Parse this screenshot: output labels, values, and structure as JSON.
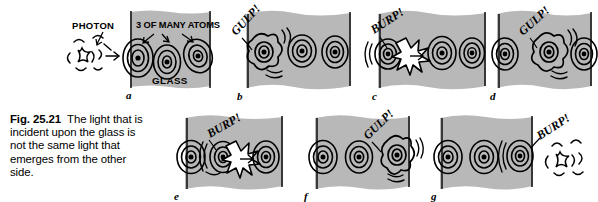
{
  "figure": {
    "number": "Fig. 25.21",
    "caption_text": "The light that is incident upon the glass is not the same light that emerges from the other side.",
    "glass_color": "#b8b8b8",
    "ink_color": "#000000",
    "background_color": "#ffffff"
  },
  "annotations": {
    "photon_label": "PHOTON",
    "atoms_label": "3 OF MANY ATOMS",
    "glass_label": "GLASS"
  },
  "panels": [
    {
      "letter": "a",
      "sound": "",
      "caption_labels": [
        "PHOTON",
        "3 OF MANY ATOMS",
        "GLASS"
      ],
      "description": "Incoming photon approaches three atoms embedded in the glass slab",
      "atom_count": 3,
      "excited_atom_index": null,
      "photon_position": "left-outside",
      "x": 130,
      "y": 12,
      "w": 82,
      "h": 76
    },
    {
      "letter": "b",
      "sound": "GULP!",
      "caption_labels": [],
      "description": "First atom absorbs the photon and becomes excited",
      "atom_count": 3,
      "excited_atom_index": 0,
      "photon_position": "absorbed-atom-1",
      "x": 246,
      "y": 12,
      "w": 105,
      "h": 76
    },
    {
      "letter": "c",
      "sound": "BURP!",
      "caption_labels": [],
      "description": "First atom re-emits the photon toward the second atom",
      "atom_count": 3,
      "excited_atom_index": 0,
      "photon_position": "emitted-between-1-2",
      "x": 382,
      "y": 12,
      "w": 105,
      "h": 76
    },
    {
      "letter": "d",
      "sound": "GULP!",
      "caption_labels": [],
      "description": "Second atom absorbs the photon and becomes excited",
      "atom_count": 3,
      "excited_atom_index": 1,
      "photon_position": "absorbed-atom-2",
      "x": 500,
      "y": 12,
      "w": 92,
      "h": 76
    },
    {
      "letter": "e",
      "sound": "BURP!",
      "caption_labels": [],
      "description": "Second atom re-emits the photon toward the third atom",
      "atom_count": 3,
      "excited_atom_index": 1,
      "photon_position": "emitted-between-2-3",
      "x": 185,
      "y": 116,
      "w": 98,
      "h": 74
    },
    {
      "letter": "f",
      "sound": "GULP!",
      "caption_labels": [],
      "description": "Third atom absorbs the photon and becomes excited",
      "atom_count": 3,
      "excited_atom_index": 2,
      "photon_position": "absorbed-atom-3",
      "x": 315,
      "y": 116,
      "w": 90,
      "h": 74
    },
    {
      "letter": "g",
      "sound": "BURP!",
      "caption_labels": [],
      "description": "Third atom re-emits a new photon which exits the far side of the glass",
      "atom_count": 3,
      "excited_atom_index": 2,
      "photon_position": "right-outside",
      "x": 440,
      "y": 116,
      "w": 92,
      "h": 74
    }
  ]
}
